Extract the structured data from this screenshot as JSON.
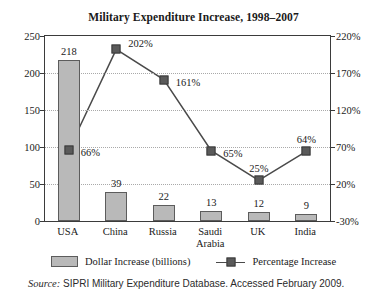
{
  "chart_data": {
    "type": "bar",
    "title": "Military Expenditure Increase, 1998–2007",
    "categories": [
      "USA",
      "China",
      "Russia",
      "Saudi Arabia",
      "UK",
      "India"
    ],
    "category_lines": [
      [
        "USA"
      ],
      [
        "China"
      ],
      [
        "Russia"
      ],
      [
        "Saudi",
        "Arabia"
      ],
      [
        "UK"
      ],
      [
        "India"
      ]
    ],
    "xlabel": "",
    "ylabel": "",
    "grid": true,
    "legend_position": "bottom",
    "series": [
      {
        "name": "Dollar Increase (billions)",
        "type": "bar",
        "axis": "left",
        "values": [
          218,
          39,
          22,
          13,
          12,
          9
        ],
        "labels": [
          "218",
          "39",
          "22",
          "13",
          "12",
          "9"
        ],
        "color": "#b9b9b9",
        "edge_color": "#5c5c5c"
      },
      {
        "name": "Percentage Increase",
        "type": "line",
        "axis": "right",
        "values": [
          66,
          202,
          161,
          65,
          25,
          64
        ],
        "labels": [
          "66%",
          "202%",
          "161%",
          "65%",
          "25%",
          "64%"
        ],
        "color": "#5a5a5a",
        "line_color": "#4a4a4a"
      }
    ],
    "left_axis": {
      "ticks": [
        0,
        50,
        100,
        150,
        200,
        250
      ],
      "tick_labels": [
        "0",
        "50",
        "100",
        "150",
        "200",
        "250"
      ],
      "ylim": [
        0,
        250
      ]
    },
    "right_axis": {
      "ticks": [
        -30,
        20,
        70,
        120,
        170,
        220
      ],
      "tick_labels": [
        "-30%",
        "20%",
        "70%",
        "120%",
        "170%",
        "220%"
      ],
      "ylim": [
        -30,
        220
      ]
    }
  },
  "legend": {
    "items": [
      {
        "label": "Dollar Increase (billions)",
        "marker": "bar-swatch"
      },
      {
        "label": "Percentage Increase",
        "marker": "line-marker-swatch"
      }
    ]
  },
  "source": {
    "prefix": "Source:",
    "text": " SIPRI Military Expenditure Database. Accessed February 2009."
  }
}
